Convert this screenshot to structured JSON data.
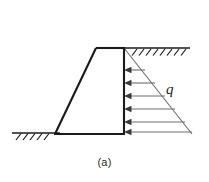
{
  "figure": {
    "caption": "(a)",
    "load_label": "q",
    "type": "engineering-diagram",
    "colors": {
      "structure_outline": "#1a1a1a",
      "ground_line": "#1a1a1a",
      "hatching": "#1a1a1a",
      "pressure_arrows": "#6e6e6e",
      "pressure_envelope": "#6e6e6e",
      "background": "#ffffff",
      "caption_text": "#2b2b2b"
    },
    "geometry": {
      "wall_top_y": 48,
      "wall_base_y": 134,
      "wall_face_x": 124,
      "crest_left_x": 96,
      "heel_left_x": 55,
      "pressure_apex_x": 192,
      "ground_left_from_x": 12,
      "ground_left_to_x": 57,
      "ground_right_from_x": 124,
      "ground_right_to_x": 190
    },
    "ground_left": {
      "name": "left ground surface",
      "hatch_count": 5
    },
    "ground_right": {
      "name": "right ground surface (backfill)",
      "hatch_count": 8
    },
    "pressure": {
      "distribution": "triangular",
      "direction": "left",
      "arrow_count": 6,
      "arrow_rows_y": [
        70,
        83,
        96,
        109,
        122,
        133
      ],
      "arrow_tail_x": [
        145,
        155,
        165,
        175,
        185,
        192
      ],
      "max_at": "base",
      "min_at": "top"
    }
  }
}
